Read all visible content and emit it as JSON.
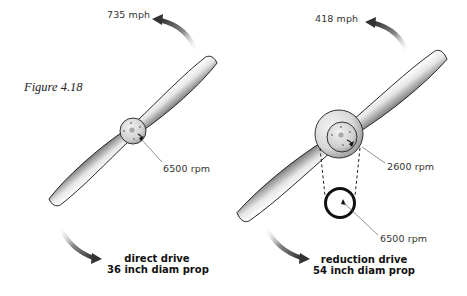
{
  "figure": {
    "title": "Figure 4.18"
  },
  "left_prop": {
    "tip_speed": "735 mph",
    "hub_rpm": "6500 rpm",
    "caption_line1": "direct drive",
    "caption_line2": "36 inch diam prop"
  },
  "right_prop": {
    "tip_speed": "418 mph",
    "prop_rpm": "2600 rpm",
    "engine_rpm": "6500 rpm",
    "caption_line1": "reduction drive",
    "caption_line2": "54 inch diam prop"
  },
  "colors": {
    "blade_light": "#f4f4f4",
    "blade_dark": "#8a8a8a",
    "outline": "#222222",
    "arrow": "#333333",
    "leader": "#666666"
  }
}
